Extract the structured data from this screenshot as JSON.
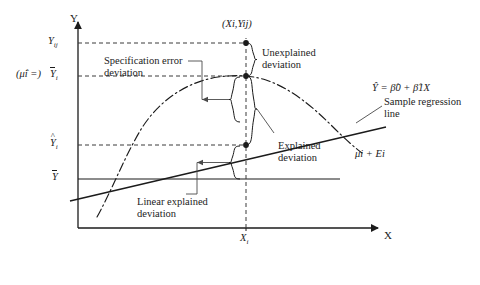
{
  "figure": {
    "type": "statistical-deviation-decomposition-diagram",
    "axes": {
      "y_axis_label": "Y",
      "x_axis_label": "X",
      "y_origin_px": 228,
      "x_origin_px": 78
    },
    "y_ticks": [
      {
        "id": "y-ij",
        "base": "Y",
        "sub": "ij",
        "overbar": false,
        "hat": false,
        "y_px": 43
      },
      {
        "id": "y-bar-i",
        "base": "Y",
        "sub": "i",
        "overbar": true,
        "hat": false,
        "y_px": 76
      },
      {
        "id": "y-hat-i",
        "base": "Y",
        "sub": "i",
        "overbar": false,
        "hat": true,
        "y_px": 145
      },
      {
        "id": "y-bar",
        "base": "Y",
        "sub": "",
        "overbar": true,
        "hat": false,
        "y_px": 179
      }
    ],
    "x_ticks": [
      {
        "id": "x-i",
        "base": "X",
        "sub": "i",
        "x_px": 246
      }
    ],
    "side_label": {
      "id": "mu-hat-equals",
      "text": "(μ̂i =)",
      "x_px": 16,
      "y_px": 69
    },
    "point_label": {
      "id": "point-xi-yij",
      "text": "(Xi,Yij)",
      "x_px": 222,
      "y_px": 20
    },
    "points": [
      {
        "id": "point-observation",
        "x_px": 246,
        "y_px": 43
      },
      {
        "id": "point-group-mean",
        "x_px": 246,
        "y_px": 76
      },
      {
        "id": "point-fitted",
        "x_px": 246,
        "y_px": 145
      }
    ],
    "annotations": [
      {
        "id": "unexplained-deviation",
        "lines": [
          "Unexplained",
          "deviation"
        ],
        "x_px": 262,
        "y_px": 49
      },
      {
        "id": "specification-error-deviation",
        "lines": [
          "Specification error",
          "deviation"
        ],
        "x_px": 104,
        "y_px": 58
      },
      {
        "id": "explained-deviation",
        "lines": [
          "Explained",
          "deviation"
        ],
        "x_px": 278,
        "y_px": 142
      },
      {
        "id": "linear-explained-deviation",
        "lines": [
          "Linear explained",
          "deviation"
        ],
        "x_px": 137,
        "y_px": 198
      },
      {
        "id": "sample-regression-line",
        "lines": [
          "Sample regression",
          "line"
        ],
        "x_px": 384,
        "y_px": 98
      }
    ],
    "equation": {
      "id": "sample-regression-equation",
      "text": "Ŷ = β̂0 + β̂1X",
      "x_px": 372,
      "y_px": 84
    },
    "curve_label": {
      "id": "mu-plus-e",
      "text": "μi + Ei",
      "x_px": 355,
      "y_px": 150
    },
    "series": {
      "true_regression_curve": {
        "id": "true-regression-curve",
        "style": "dash-dot",
        "note": "concave nonlinear mean function mu_i"
      },
      "sample_regression_line": {
        "id": "sample-regression-line-path",
        "style": "solid",
        "note": "fitted straight line Yhat = b0 + b1 X"
      },
      "grand_mean_line": {
        "id": "grand-mean-line",
        "style": "solid-horizontal",
        "note": "horizontal line at Ybar"
      }
    },
    "colors": {
      "ink": "#1b1b1b",
      "guide": "#4a4a4a",
      "background": "#ffffff"
    }
  }
}
